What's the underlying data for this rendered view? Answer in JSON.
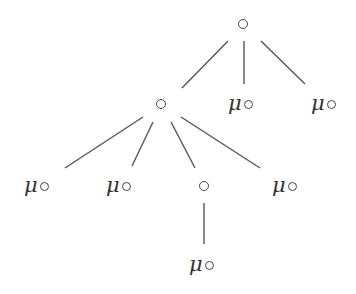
{
  "diagram": {
    "type": "tree",
    "edge_color": "#555555",
    "edges": [
      {
        "from": "root",
        "to": "n1",
        "x1": 228,
        "y1": 41,
        "x2": 182,
        "y2": 88
      },
      {
        "from": "root",
        "to": "n2",
        "x1": 244,
        "y1": 41,
        "x2": 244,
        "y2": 84
      },
      {
        "from": "root",
        "to": "n3",
        "x1": 261,
        "y1": 41,
        "x2": 305,
        "y2": 84
      },
      {
        "from": "n1",
        "to": "n4",
        "x1": 143,
        "y1": 117,
        "x2": 65,
        "y2": 168
      },
      {
        "from": "n1",
        "to": "n5",
        "x1": 153,
        "y1": 122,
        "x2": 132,
        "y2": 166
      },
      {
        "from": "n1",
        "to": "n6",
        "x1": 171,
        "y1": 122,
        "x2": 195,
        "y2": 168
      },
      {
        "from": "n1",
        "to": "n7",
        "x1": 181,
        "y1": 117,
        "x2": 260,
        "y2": 168
      },
      {
        "from": "n6",
        "to": "n8",
        "x1": 204,
        "y1": 203,
        "x2": 204,
        "y2": 244
      }
    ],
    "nodes": [
      {
        "id": "root",
        "label": "",
        "symbol": "∘",
        "kind": "circle",
        "x": 238,
        "y": 19
      },
      {
        "id": "n1",
        "label": "",
        "symbol": "∘",
        "kind": "circle",
        "x": 156,
        "y": 99
      },
      {
        "id": "n2",
        "label": "μ",
        "symbol": "∘",
        "kind": "mu-circle",
        "x": 228,
        "y": 93
      },
      {
        "id": "n3",
        "label": "μ",
        "symbol": "∘",
        "kind": "mu-circle",
        "x": 311,
        "y": 93
      },
      {
        "id": "n4",
        "label": "μ",
        "symbol": "∘",
        "kind": "mu-circle",
        "x": 24,
        "y": 175
      },
      {
        "id": "n5",
        "label": "μ",
        "symbol": "∘",
        "kind": "mu-circle",
        "x": 106,
        "y": 175
      },
      {
        "id": "n6",
        "label": "",
        "symbol": "∘",
        "kind": "circle",
        "x": 199,
        "y": 181
      },
      {
        "id": "n7",
        "label": "μ",
        "symbol": "∘",
        "kind": "mu-circle",
        "x": 272,
        "y": 175
      },
      {
        "id": "n8",
        "label": "μ",
        "symbol": "∘",
        "kind": "mu-circle",
        "x": 189,
        "y": 254
      }
    ]
  }
}
